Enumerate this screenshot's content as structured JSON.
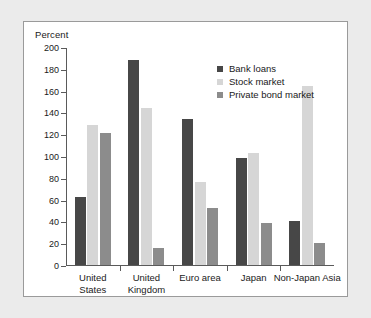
{
  "chart_data": {
    "type": "bar",
    "title": "",
    "subtitle": "",
    "xlabel": "",
    "ylabel": "Percent",
    "ylim": [
      0,
      200
    ],
    "ytick_values": [
      0,
      20,
      40,
      60,
      80,
      100,
      120,
      140,
      160,
      180,
      200
    ],
    "ytick_labels": [
      "0",
      "20",
      "40",
      "60",
      "80",
      "100",
      "120",
      "140",
      "160",
      "180",
      "200"
    ],
    "grid": false,
    "legend_position": "top-right",
    "categories": [
      "United States",
      "United Kingdom",
      "Euro area",
      "Japan",
      "Non-Japan Asia"
    ],
    "category_lines": [
      [
        "United",
        "States"
      ],
      [
        "United",
        "Kingdom"
      ],
      [
        "Euro area"
      ],
      [
        "Japan"
      ],
      [
        "Non-Japan Asia"
      ]
    ],
    "series": [
      {
        "name": "Bank loans",
        "color": "#474747",
        "values": [
          62,
          188,
          134,
          98,
          40.5
        ]
      },
      {
        "name": "Stock market",
        "color": "#d6d6d6",
        "values": [
          128,
          144,
          76,
          103,
          164.5
        ]
      },
      {
        "name": "Private bond market",
        "color": "#8c8c8c",
        "values": [
          121,
          16,
          52,
          38.5,
          20
        ]
      }
    ]
  },
  "colors": {
    "page_background": "#ebebeb",
    "panel_background": "#ffffff",
    "panel_border": "#9a9a9a",
    "axis": "#5a5a5a",
    "text": "#1a1a1a"
  }
}
